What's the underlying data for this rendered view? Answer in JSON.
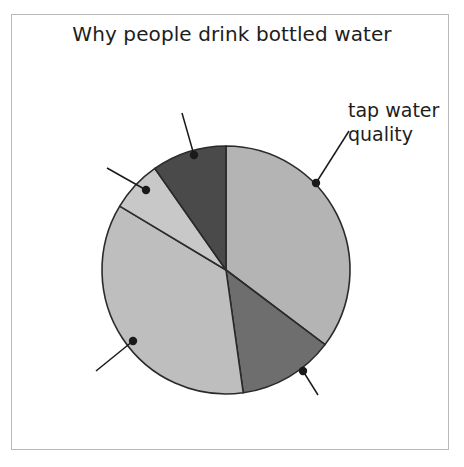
{
  "chart_data": {
    "type": "pie",
    "title": "Why people drink bottled water",
    "xlabel": "",
    "ylabel": "",
    "legend_position": "none",
    "grid": false,
    "center": {
      "x": 226,
      "y": 270
    },
    "radius": 124,
    "labels": [
      "tap water quality",
      "",
      "",
      "",
      ""
    ],
    "categories": [
      "tap water quality",
      "slice-2",
      "slice-3",
      "slice-4",
      "slice-5"
    ],
    "values": [
      35,
      12.5,
      35,
      6.5,
      11
    ],
    "slices": [
      {
        "name": "tap water quality",
        "label": "tap water quality",
        "value": 35,
        "percent": 35,
        "color": "#b4b4b4",
        "start_angle": -90,
        "end_angle": 37,
        "labeled": true,
        "marker": {
          "x": 316,
          "y": 183
        }
      },
      {
        "name": "slice-2",
        "label": "",
        "value": 12.5,
        "percent": 12.5,
        "color": "#6e6e6e",
        "start_angle": 37,
        "end_angle": 82,
        "labeled": false,
        "marker": {
          "x": 303,
          "y": 371
        }
      },
      {
        "name": "slice-3",
        "label": "",
        "value": 35,
        "percent": 35,
        "color": "#bebebe",
        "start_angle": 82,
        "end_angle": 211,
        "labeled": false,
        "marker": {
          "x": 133,
          "y": 341
        }
      },
      {
        "name": "slice-4",
        "label": "",
        "value": 6.5,
        "percent": 6.5,
        "color": "#c8c8c8",
        "start_angle": 211,
        "end_angle": 235,
        "labeled": false,
        "marker": {
          "x": 146,
          "y": 190
        }
      },
      {
        "name": "slice-5",
        "label": "",
        "value": 11,
        "percent": 11,
        "color": "#4a4a4a",
        "start_angle": 235,
        "end_angle": 270,
        "labeled": false,
        "marker": {
          "x": 194,
          "y": 155
        }
      }
    ],
    "leader_lines": [
      {
        "from": {
          "x": 316,
          "y": 183
        },
        "to": {
          "x": 349,
          "y": 131
        }
      },
      {
        "from": {
          "x": 303,
          "y": 371
        },
        "to": {
          "x": 318,
          "y": 395
        }
      },
      {
        "from": {
          "x": 133,
          "y": 341
        },
        "to": {
          "x": 96,
          "y": 371
        }
      },
      {
        "from": {
          "x": 146,
          "y": 190
        },
        "to": {
          "x": 107,
          "y": 168
        }
      },
      {
        "from": {
          "x": 194,
          "y": 155
        },
        "to": {
          "x": 182,
          "y": 113
        }
      }
    ],
    "style": {
      "slice_outline": "#2a2a2a",
      "background": "#ffffff",
      "frame_border": "#b9b9b9",
      "text_color": "#1d1d1d",
      "marker_color": "#1a1a1a"
    }
  },
  "labels": {
    "tap_water_line1": "tap water",
    "tap_water_line2": "quality"
  }
}
